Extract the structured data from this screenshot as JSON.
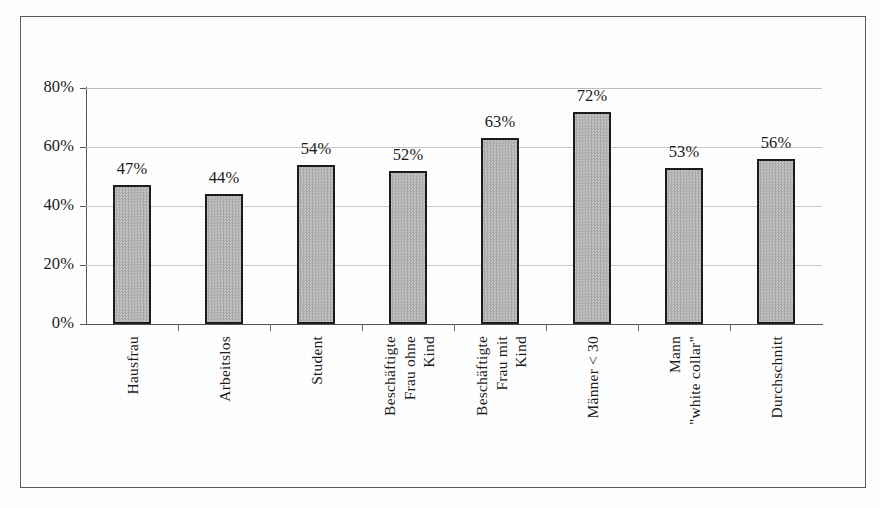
{
  "figure": {
    "background": "#ffffff",
    "frame_color": "#5d5d5d",
    "bar_fill": "#b7b7b7",
    "bar_border": "#1c1c1c",
    "gridline_color": "#c8c8c8",
    "axis_color": "#555555",
    "text_color": "#1b1b1b"
  },
  "chart_data": {
    "type": "bar",
    "title": "",
    "subtitle": "",
    "xlabel": "",
    "ylabel": "",
    "grid": true,
    "legend": null,
    "ylim": [
      0,
      80
    ],
    "yticks": [
      0,
      20,
      40,
      60,
      80
    ],
    "ytick_labels": [
      "0%",
      "20%",
      "40%",
      "60%",
      "80%"
    ],
    "value_suffix": "%",
    "categories": [
      "Hausfrau",
      "Arbeitslos",
      "Student",
      "Beschäftigte Frau ohne Kind",
      "Beschäftigte Frau mit Kind",
      "Männer < 30",
      "Mann \"white collar\"",
      "Durchschnitt"
    ],
    "category_lines": [
      [
        "Hausfrau"
      ],
      [
        "Arbeitslos"
      ],
      [
        "Student"
      ],
      [
        "Beschäftigte",
        "Frau ohne",
        "Kind"
      ],
      [
        "Beschäftigte",
        "Frau mit",
        "Kind"
      ],
      [
        "Männer < 30"
      ],
      [
        "Mann",
        "\"white collar\""
      ],
      [
        "Durchschnitt"
      ]
    ],
    "values": [
      47,
      44,
      54,
      52,
      63,
      72,
      53,
      56
    ],
    "data_labels": [
      "47%",
      "44%",
      "54%",
      "52%",
      "63%",
      "72%",
      "53%",
      "56%"
    ]
  }
}
